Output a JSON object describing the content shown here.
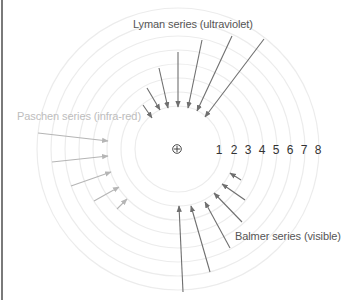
{
  "diagram": {
    "nucleus": {
      "symbol": "plus-in-circle",
      "cx": 178,
      "cy": 149
    },
    "shells": {
      "labels": [
        "1",
        "2",
        "3",
        "4",
        "5",
        "6",
        "7",
        "8"
      ],
      "radii": [
        43,
        57,
        71,
        85,
        99,
        113,
        127,
        141
      ],
      "label_x": [
        219,
        234,
        248,
        262,
        276,
        290,
        304,
        318
      ],
      "color": "#ececec"
    },
    "series": [
      {
        "name": "Lyman series (ultraviolet)",
        "color": "#6f6f6f",
        "label_color": "#555555",
        "arrows": [
          {
            "x1": 143,
            "y1": 105,
            "x2": 152,
            "y2": 118
          },
          {
            "x1": 147,
            "y1": 88,
            "x2": 160,
            "y2": 110
          },
          {
            "x1": 159,
            "y1": 68,
            "x2": 168,
            "y2": 108
          },
          {
            "x1": 178,
            "y1": 52,
            "x2": 178,
            "y2": 107
          },
          {
            "x1": 202,
            "y1": 40,
            "x2": 188,
            "y2": 108
          },
          {
            "x1": 232,
            "y1": 36,
            "x2": 197,
            "y2": 111
          },
          {
            "x1": 264,
            "y1": 39,
            "x2": 205,
            "y2": 117
          }
        ]
      },
      {
        "name": "Paschen series (infra-red)",
        "color": "#b5b5b5",
        "label_color": "#bdbdbd",
        "arrows": [
          {
            "x1": 38,
            "y1": 133,
            "x2": 108,
            "y2": 141
          },
          {
            "x1": 52,
            "y1": 162,
            "x2": 108,
            "y2": 156
          },
          {
            "x1": 71,
            "y1": 186,
            "x2": 111,
            "y2": 172
          },
          {
            "x1": 94,
            "y1": 201,
            "x2": 119,
            "y2": 187
          },
          {
            "x1": 117,
            "y1": 209,
            "x2": 127,
            "y2": 199
          }
        ]
      },
      {
        "name": "Balmer series (visible)",
        "color": "#6f6f6f",
        "label_color": "#555555",
        "arrows": [
          {
            "x1": 241,
            "y1": 180,
            "x2": 230,
            "y2": 173
          },
          {
            "x1": 245,
            "y1": 200,
            "x2": 222,
            "y2": 184
          },
          {
            "x1": 242,
            "y1": 222,
            "x2": 214,
            "y2": 193
          },
          {
            "x1": 230,
            "y1": 248,
            "x2": 205,
            "y2": 202
          },
          {
            "x1": 210,
            "y1": 272,
            "x2": 191,
            "y2": 206
          },
          {
            "x1": 183,
            "y1": 292,
            "x2": 179,
            "y2": 206
          }
        ]
      }
    ]
  }
}
